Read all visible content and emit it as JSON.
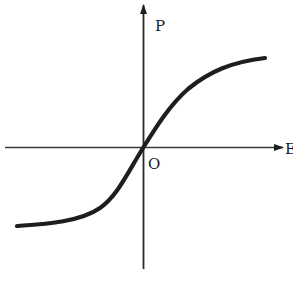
{
  "diagram": {
    "type": "hysteresis-free polarization curve (P vs E)",
    "axes": {
      "vertical_label": "P",
      "horizontal_label": "E",
      "origin_label": "O"
    },
    "curve": {
      "shape": "S-shaped (sigmoid) through origin, saturating at both ends",
      "color": "#1e1e1e"
    },
    "colors": {
      "background": "#ffffff",
      "stroke": "#1e1e1e"
    }
  }
}
